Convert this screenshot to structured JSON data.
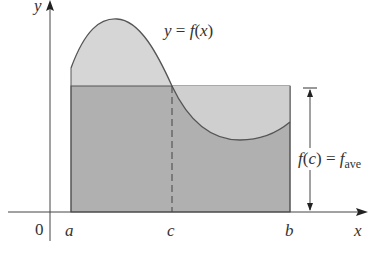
{
  "figure": {
    "curve_label": {
      "y": "y",
      "eq": " = ",
      "f": "f",
      "paren_open": "(",
      "x": "x",
      "paren_close": ")"
    },
    "axis_labels": {
      "x": "x",
      "y": "y",
      "origin": "0"
    },
    "tick_labels": {
      "a": "a",
      "c": "c",
      "b": "b"
    },
    "fave_label": {
      "f": "f",
      "paren_open": "(",
      "c": "c",
      "paren_close": ")",
      "eq": " = ",
      "f2": "f",
      "sub": "ave"
    },
    "colors": {
      "light_fill": "#d4d4d4",
      "dark_fill": "#a6a6a6",
      "curve": "#555555",
      "axis": "#444444"
    }
  }
}
